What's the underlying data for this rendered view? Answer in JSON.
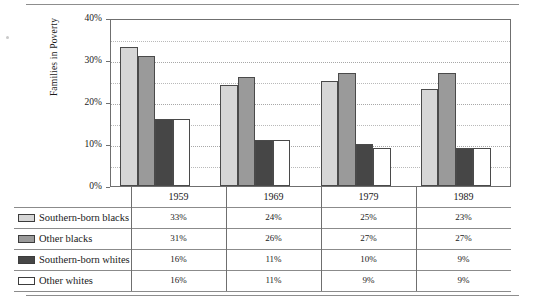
{
  "chart_data": {
    "type": "bar",
    "title": "",
    "xlabel": "",
    "ylabel": "Families in Poverty",
    "categories": [
      "1959",
      "1969",
      "1979",
      "1989"
    ],
    "ylim": [
      0,
      40
    ],
    "ytick_labels": [
      "0%",
      "10%",
      "20%",
      "30%",
      "40%"
    ],
    "ytick_values": [
      0,
      10,
      20,
      30,
      40
    ],
    "gridlines": "horizontal dotted at 5% intervals",
    "legend_position": "table below chart",
    "series": [
      {
        "name": "Southern-born blacks",
        "color": "#d6d6d6",
        "values": [
          33,
          24,
          25,
          23
        ],
        "labels": [
          "33%",
          "24%",
          "25%",
          "23%"
        ]
      },
      {
        "name": "Other blacks",
        "color": "#9a9a9a",
        "values": [
          31,
          26,
          27,
          27
        ],
        "labels": [
          "31%",
          "26%",
          "27%",
          "27%"
        ]
      },
      {
        "name": "Southern-born whites",
        "color": "#464646",
        "values": [
          16,
          11,
          10,
          9
        ],
        "labels": [
          "16%",
          "11%",
          "10%",
          "9%"
        ]
      },
      {
        "name": "Other whites",
        "color": "#ffffff",
        "values": [
          16,
          11,
          9,
          9
        ],
        "labels": [
          "16%",
          "11%",
          "9%",
          "9%"
        ]
      }
    ]
  },
  "table": {
    "year_headers": [
      "1959",
      "1969",
      "1979",
      "1989"
    ],
    "rows": [
      {
        "label": "Southern-born blacks",
        "swatch": "#d6d6d6",
        "values": [
          "33%",
          "24%",
          "25%",
          "23%"
        ]
      },
      {
        "label": "Other blacks",
        "swatch": "#9a9a9a",
        "values": [
          "31%",
          "26%",
          "27%",
          "27%"
        ]
      },
      {
        "label": "Southern-born whites",
        "swatch": "#464646",
        "values": [
          "16%",
          "11%",
          "10%",
          "9%"
        ]
      },
      {
        "label": "Other whites",
        "swatch": "#ffffff",
        "values": [
          "16%",
          "11%",
          "9%",
          "9%"
        ]
      }
    ]
  },
  "colors": {
    "frame": "#6f6f6f",
    "rule": "#8b8b8b",
    "grid": "#b9b9b9",
    "text": "#1a1a1a"
  }
}
